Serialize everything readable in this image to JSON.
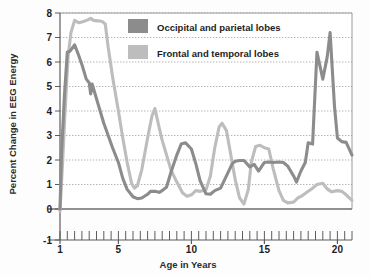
{
  "chart_data": {
    "type": "line",
    "title": "",
    "xlabel": "Age in Years",
    "ylabel": "Percent Change in EEG Energy",
    "xlim": [
      1,
      21
    ],
    "ylim": [
      -1,
      8
    ],
    "yticks": [
      -1,
      0,
      1,
      2,
      3,
      4,
      5,
      6,
      7,
      8
    ],
    "ytick_labels": [
      "-1",
      "0",
      "1",
      "2",
      "3",
      "4",
      "5",
      "6",
      "7",
      "8"
    ],
    "xticks": [
      1,
      5,
      10,
      15,
      20
    ],
    "xtick_labels": [
      "1",
      "5",
      "10",
      "15",
      "20"
    ],
    "x_minor_tick_step": 0.5,
    "grid": "horizontal-dotted",
    "legend_position": "top-center",
    "series": [
      {
        "name": "Occipital and parietal lobes",
        "color": "#8c8c8c",
        "x": [
          1.0,
          1.1,
          1.3,
          1.5,
          1.7,
          2.0,
          2.2,
          2.5,
          2.8,
          3.0,
          3.1,
          3.2,
          3.5,
          3.8,
          4.0,
          4.3,
          4.6,
          5.0,
          5.3,
          5.6,
          6.0,
          6.3,
          6.6,
          7.0,
          7.2,
          7.5,
          7.8,
          8.0,
          8.3,
          8.6,
          9.0,
          9.3,
          9.6,
          10.0,
          10.3,
          10.6,
          11.0,
          11.3,
          11.6,
          12.0,
          12.4,
          12.8,
          13.0,
          13.3,
          13.6,
          14.0,
          14.3,
          14.6,
          15.0,
          15.3,
          15.6,
          16.0,
          16.3,
          16.6,
          17.0,
          17.2,
          17.5,
          17.8,
          18.0,
          18.3,
          18.6,
          19.0,
          19.3,
          19.5,
          19.8,
          20.0,
          20.3,
          20.6,
          21.0
        ],
        "y": [
          0.0,
          2.2,
          4.6,
          6.4,
          6.45,
          6.7,
          6.4,
          5.9,
          5.3,
          5.15,
          4.7,
          5.1,
          4.5,
          3.9,
          3.5,
          3.0,
          2.5,
          1.9,
          1.25,
          0.8,
          0.5,
          0.42,
          0.45,
          0.6,
          0.72,
          0.72,
          0.68,
          0.75,
          0.9,
          1.5,
          2.2,
          2.65,
          2.7,
          2.45,
          1.85,
          1.15,
          0.62,
          0.6,
          0.75,
          0.85,
          1.35,
          1.85,
          1.95,
          1.98,
          1.98,
          1.72,
          1.82,
          1.55,
          1.9,
          1.92,
          1.9,
          1.92,
          1.9,
          1.75,
          1.35,
          1.1,
          1.55,
          1.9,
          2.7,
          2.65,
          6.4,
          5.3,
          6.2,
          7.2,
          4.2,
          2.9,
          2.75,
          2.72,
          2.2
        ]
      },
      {
        "name": "Frontal and temporal lobes",
        "color": "#bdbdbd",
        "x": [
          1.0,
          1.15,
          1.35,
          1.55,
          1.75,
          2.0,
          2.3,
          2.6,
          2.9,
          3.1,
          3.3,
          3.6,
          3.9,
          4.1,
          4.3,
          4.6,
          5.0,
          5.3,
          5.6,
          5.9,
          6.1,
          6.3,
          6.6,
          7.0,
          7.3,
          7.5,
          7.8,
          8.0,
          8.3,
          8.6,
          9.0,
          9.4,
          9.7,
          10.0,
          10.3,
          10.6,
          11.0,
          11.3,
          11.6,
          11.9,
          12.1,
          12.4,
          12.7,
          13.0,
          13.3,
          13.6,
          13.9,
          14.1,
          14.4,
          14.7,
          15.0,
          15.3,
          15.6,
          16.0,
          16.3,
          16.6,
          17.0,
          17.3,
          17.6,
          18.0,
          18.3,
          18.6,
          19.0,
          19.3,
          19.6,
          20.0,
          20.3,
          20.6,
          21.0
        ],
        "y": [
          -0.1,
          1.6,
          4.0,
          6.2,
          7.2,
          7.7,
          7.6,
          7.65,
          7.72,
          7.78,
          7.7,
          7.68,
          7.65,
          7.55,
          6.6,
          5.4,
          4.0,
          2.9,
          1.9,
          1.05,
          0.85,
          0.95,
          1.6,
          2.9,
          3.8,
          4.1,
          3.3,
          2.8,
          2.2,
          1.6,
          1.1,
          0.65,
          0.52,
          0.58,
          0.75,
          0.72,
          0.78,
          1.35,
          2.5,
          3.35,
          3.5,
          3.2,
          2.2,
          1.2,
          0.45,
          0.2,
          0.8,
          1.9,
          2.55,
          2.6,
          2.5,
          2.45,
          1.65,
          0.75,
          0.35,
          0.25,
          0.28,
          0.45,
          0.55,
          0.72,
          0.85,
          1.0,
          1.05,
          0.82,
          0.7,
          0.75,
          0.72,
          0.58,
          0.35
        ]
      }
    ]
  },
  "legend": {
    "items": [
      {
        "label": "Occipital and parietal lobes",
        "color": "#8c8c8c"
      },
      {
        "label": "Frontal and temporal lobes",
        "color": "#bdbdbd"
      }
    ]
  },
  "axes": {
    "x_title": "Age in Years",
    "y_title": "Percent Change in EEG Energy",
    "y_labels": [
      "8",
      "7",
      "6",
      "5",
      "4",
      "3",
      "2",
      "1",
      "0",
      "-1"
    ],
    "x_labels": [
      "1",
      "5",
      "10",
      "15",
      "20"
    ]
  }
}
